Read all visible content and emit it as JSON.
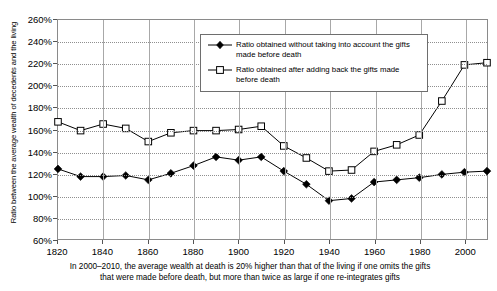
{
  "chart_data": {
    "type": "line",
    "title": "",
    "xlabel": "",
    "ylabel": "Ratio between the average wealth of decedents and the living",
    "xlim": [
      1820,
      2010
    ],
    "ylim": [
      60,
      260
    ],
    "ytick_suffix": "%",
    "grid": true,
    "legend_position": "top-center",
    "yticks": [
      "60%",
      "80%",
      "100%",
      "120%",
      "140%",
      "160%",
      "180%",
      "200%",
      "220%",
      "240%",
      "260%"
    ],
    "ytick_values": [
      60,
      80,
      100,
      120,
      140,
      160,
      180,
      200,
      220,
      240,
      260
    ],
    "xticks": [
      "1820",
      "1840",
      "1860",
      "1880",
      "1900",
      "1920",
      "1940",
      "1960",
      "1980",
      "2000"
    ],
    "xtick_values": [
      1820,
      1840,
      1860,
      1880,
      1900,
      1920,
      1940,
      1960,
      1980,
      2000
    ],
    "x": [
      1820,
      1830,
      1840,
      1850,
      1860,
      1870,
      1880,
      1890,
      1900,
      1910,
      1920,
      1930,
      1940,
      1950,
      1960,
      1970,
      1980,
      1990,
      2000,
      2010
    ],
    "series": [
      {
        "name": "Ratio obtained without taking into account the gifts made before death",
        "marker": "filled-diamond",
        "color": "#000000",
        "values": [
          124,
          117,
          117,
          118,
          114,
          120,
          127,
          135,
          132,
          135,
          122,
          110,
          95,
          97,
          112,
          114,
          116,
          119,
          121,
          122
        ]
      },
      {
        "name": "Ratio obtained after adding back the gifts made before death",
        "marker": "open-square",
        "color": "#000000",
        "values": [
          167,
          159,
          165,
          161,
          149,
          157,
          159,
          159,
          160,
          163,
          145,
          134,
          122,
          123,
          140,
          146,
          155,
          186,
          219,
          221
        ]
      }
    ],
    "annotation": ""
  },
  "legend": {
    "items": [
      {
        "marker": "filled-diamond",
        "label": "Ratio obtained without taking into account the gifts made before death"
      },
      {
        "marker": "open-square",
        "label": "Ratio obtained after adding back the gifts made before death"
      }
    ]
  },
  "caption": {
    "line1": "In 2000–2010, the average wealth at death is 20% higher than that of the living if one omits the gifts",
    "line2": "that were made before death, but more than twice as large if one re-integrates gifts"
  }
}
